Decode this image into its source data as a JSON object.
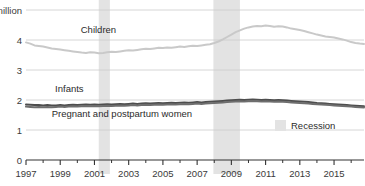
{
  "chart_data": {
    "type": "line",
    "title": "",
    "subtitle": "",
    "xlabel": "",
    "ylabel": "",
    "ylim": [
      0,
      5
    ],
    "xlim": [
      1997,
      2016.75
    ],
    "grid": true,
    "grid_axis": "y",
    "legend_position": "bottom-right",
    "y_ticks": [
      0,
      1,
      2,
      3,
      4,
      5
    ],
    "y_tick_labels": [
      "0",
      "1",
      "2",
      "3",
      "4",
      "5 million"
    ],
    "x_ticks": [
      1997,
      1999,
      2001,
      2003,
      2005,
      2007,
      2009,
      2011,
      2013,
      2015
    ],
    "x_tick_labels": [
      "1997",
      "1999",
      "2001",
      "2003",
      "2005",
      "2007",
      "2009",
      "2011",
      "2013",
      "2015"
    ],
    "x_minor_ticks": [
      1998,
      2000,
      2002,
      2004,
      2006,
      2008,
      2010,
      2012,
      2014,
      2016
    ],
    "units": "million",
    "series": [
      {
        "name": "Children",
        "color": "#c9c9c9",
        "label_x": 2000.2,
        "label_y": 4.22,
        "x": [
          1997,
          1997.25,
          1997.5,
          1997.75,
          1998,
          1998.25,
          1998.5,
          1998.75,
          1999,
          1999.25,
          1999.5,
          1999.75,
          2000,
          2000.25,
          2000.5,
          2000.75,
          2001,
          2001.25,
          2001.5,
          2001.75,
          2002,
          2002.25,
          2002.5,
          2002.75,
          2003,
          2003.25,
          2003.5,
          2003.75,
          2004,
          2004.25,
          2004.5,
          2004.75,
          2005,
          2005.25,
          2005.5,
          2005.75,
          2006,
          2006.25,
          2006.5,
          2006.75,
          2007,
          2007.25,
          2007.5,
          2007.75,
          2008,
          2008.25,
          2008.5,
          2008.75,
          2009,
          2009.25,
          2009.5,
          2009.75,
          2010,
          2010.25,
          2010.5,
          2010.75,
          2011,
          2011.25,
          2011.5,
          2011.75,
          2012,
          2012.25,
          2012.5,
          2012.75,
          2013,
          2013.25,
          2013.5,
          2013.75,
          2014,
          2014.25,
          2014.5,
          2014.75,
          2015,
          2015.25,
          2015.5,
          2015.75,
          2016,
          2016.25,
          2016.5,
          2016.75
        ],
        "y": [
          3.92,
          3.88,
          3.82,
          3.8,
          3.78,
          3.75,
          3.72,
          3.7,
          3.68,
          3.66,
          3.64,
          3.62,
          3.6,
          3.58,
          3.57,
          3.59,
          3.58,
          3.56,
          3.57,
          3.59,
          3.61,
          3.6,
          3.62,
          3.64,
          3.66,
          3.65,
          3.67,
          3.69,
          3.71,
          3.7,
          3.72,
          3.74,
          3.73,
          3.75,
          3.74,
          3.76,
          3.78,
          3.77,
          3.79,
          3.81,
          3.8,
          3.82,
          3.84,
          3.86,
          3.9,
          3.95,
          4.02,
          4.1,
          4.18,
          4.26,
          4.32,
          4.38,
          4.42,
          4.45,
          4.47,
          4.46,
          4.48,
          4.47,
          4.44,
          4.46,
          4.45,
          4.42,
          4.38,
          4.36,
          4.33,
          4.3,
          4.26,
          4.22,
          4.18,
          4.15,
          4.12,
          4.1,
          4.08,
          4.05,
          4.02,
          3.98,
          3.93,
          3.9,
          3.88,
          3.87
        ]
      },
      {
        "name": "Infants",
        "color": "#4d4d4d",
        "label_x": 1998.7,
        "label_y": 2.28,
        "x": [
          1997,
          1997.25,
          1997.5,
          1997.75,
          1998,
          1998.25,
          1998.5,
          1998.75,
          1999,
          1999.25,
          1999.5,
          1999.75,
          2000,
          2000.25,
          2000.5,
          2000.75,
          2001,
          2001.25,
          2001.5,
          2001.75,
          2002,
          2002.25,
          2002.5,
          2002.75,
          2003,
          2003.25,
          2003.5,
          2003.75,
          2004,
          2004.25,
          2004.5,
          2004.75,
          2005,
          2005.25,
          2005.5,
          2005.75,
          2006,
          2006.25,
          2006.5,
          2006.75,
          2007,
          2007.25,
          2007.5,
          2007.75,
          2008,
          2008.25,
          2008.5,
          2008.75,
          2009,
          2009.25,
          2009.5,
          2009.75,
          2010,
          2010.25,
          2010.5,
          2010.75,
          2011,
          2011.25,
          2011.5,
          2011.75,
          2012,
          2012.25,
          2012.5,
          2012.75,
          2013,
          2013.25,
          2013.5,
          2013.75,
          2014,
          2014.25,
          2014.5,
          2014.75,
          2015,
          2015.25,
          2015.5,
          2015.75,
          2016,
          2016.25,
          2016.5,
          2016.75
        ],
        "y": [
          1.85,
          1.84,
          1.83,
          1.83,
          1.82,
          1.83,
          1.82,
          1.82,
          1.83,
          1.82,
          1.83,
          1.84,
          1.83,
          1.84,
          1.85,
          1.84,
          1.85,
          1.84,
          1.85,
          1.86,
          1.85,
          1.86,
          1.87,
          1.86,
          1.87,
          1.88,
          1.87,
          1.88,
          1.89,
          1.88,
          1.89,
          1.9,
          1.89,
          1.9,
          1.91,
          1.9,
          1.91,
          1.92,
          1.91,
          1.92,
          1.93,
          1.92,
          1.93,
          1.94,
          1.95,
          1.96,
          1.97,
          1.98,
          1.99,
          2.0,
          2.01,
          2.0,
          2.01,
          2.02,
          2.01,
          2.0,
          2.01,
          2.0,
          1.99,
          2.0,
          1.99,
          1.98,
          1.97,
          1.96,
          1.95,
          1.94,
          1.93,
          1.92,
          1.9,
          1.89,
          1.88,
          1.87,
          1.86,
          1.85,
          1.84,
          1.83,
          1.82,
          1.81,
          1.8,
          1.79
        ]
      },
      {
        "name": "Pregnant and postpartum women",
        "color": "#6e6e6e",
        "label_x": 1998.5,
        "label_y": 1.42,
        "x": [
          1997,
          1997.25,
          1997.5,
          1997.75,
          1998,
          1998.25,
          1998.5,
          1998.75,
          1999,
          1999.25,
          1999.5,
          1999.75,
          2000,
          2000.25,
          2000.5,
          2000.75,
          2001,
          2001.25,
          2001.5,
          2001.75,
          2002,
          2002.25,
          2002.5,
          2002.75,
          2003,
          2003.25,
          2003.5,
          2003.75,
          2004,
          2004.25,
          2004.5,
          2004.75,
          2005,
          2005.25,
          2005.5,
          2005.75,
          2006,
          2006.25,
          2006.5,
          2006.75,
          2007,
          2007.25,
          2007.5,
          2007.75,
          2008,
          2008.25,
          2008.5,
          2008.75,
          2009,
          2009.25,
          2009.5,
          2009.75,
          2010,
          2010.25,
          2010.5,
          2010.75,
          2011,
          2011.25,
          2011.5,
          2011.75,
          2012,
          2012.25,
          2012.5,
          2012.75,
          2013,
          2013.25,
          2013.5,
          2013.75,
          2014,
          2014.25,
          2014.5,
          2014.75,
          2015,
          2015.25,
          2015.5,
          2015.75,
          2016,
          2016.25,
          2016.5,
          2016.75
        ],
        "y": [
          1.78,
          1.77,
          1.76,
          1.77,
          1.76,
          1.77,
          1.76,
          1.77,
          1.78,
          1.77,
          1.78,
          1.79,
          1.78,
          1.79,
          1.8,
          1.79,
          1.8,
          1.79,
          1.8,
          1.81,
          1.8,
          1.81,
          1.82,
          1.81,
          1.82,
          1.83,
          1.82,
          1.83,
          1.84,
          1.83,
          1.84,
          1.85,
          1.84,
          1.85,
          1.86,
          1.85,
          1.86,
          1.87,
          1.86,
          1.87,
          1.88,
          1.87,
          1.88,
          1.89,
          1.9,
          1.91,
          1.92,
          1.93,
          1.94,
          1.95,
          1.96,
          1.95,
          1.96,
          1.97,
          1.96,
          1.95,
          1.96,
          1.95,
          1.94,
          1.95,
          1.94,
          1.93,
          1.92,
          1.91,
          1.9,
          1.89,
          1.88,
          1.87,
          1.86,
          1.85,
          1.84,
          1.83,
          1.82,
          1.81,
          1.8,
          1.79,
          1.78,
          1.77,
          1.76,
          1.75
        ]
      }
    ],
    "recessions": [
      {
        "name": "2001 recession",
        "start": 2001.25,
        "end": 2001.9
      },
      {
        "name": "2008 recession",
        "start": 2007.95,
        "end": 2009.5
      }
    ],
    "recession_color": "#e3e3e3",
    "legend": [
      {
        "label": "Recession",
        "type": "swatch",
        "color": "#e3e3e3"
      }
    ]
  }
}
